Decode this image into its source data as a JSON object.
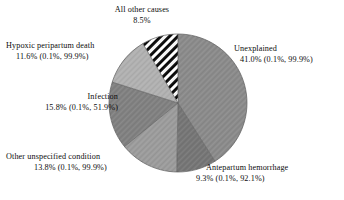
{
  "chart_data": {
    "type": "pie",
    "title": "",
    "subtitle": "",
    "xlabel": "",
    "ylabel": "",
    "legend_position": "none",
    "grid": false,
    "start_angle_deg": 0,
    "direction": "clockwise",
    "center": {
      "x": 178,
      "y": 103
    },
    "radius": 69,
    "categories": [
      "Unexplained",
      "Antepartum hemorrhage",
      "Other unspecified condition",
      "Infection",
      "Hypoxic peripartum death",
      "All other causes"
    ],
    "values": [
      41.0,
      9.3,
      13.8,
      15.8,
      11.6,
      8.5
    ],
    "slices": [
      {
        "name": "Unexplained",
        "label": "Unexplained",
        "percent": 41.0,
        "percent_text": "41.0%",
        "ci_text": "(0.1%, 99.9%)",
        "value_line": "41.0% (0.1%, 99.9%)",
        "ci_low": 0.1,
        "ci_high": 99.9,
        "fill": "#8b8b8b",
        "pattern": "solid"
      },
      {
        "name": "Antepartum hemorrhage",
        "label": "Antepartum hemorrhage",
        "percent": 9.3,
        "percent_text": "9.3%",
        "ci_text": "(0.1%, 92.1%)",
        "value_line": "9.3% (0.1%, 92.1%)",
        "ci_low": 0.1,
        "ci_high": 92.1,
        "fill": "#767676",
        "pattern": "solid"
      },
      {
        "name": "Other unspecified condition",
        "label": "Other unspecified condition",
        "percent": 13.8,
        "percent_text": "13.8%",
        "ci_text": "(0.1%, 99.9%)",
        "value_line": "13.8% (0.1%, 99.9%)",
        "ci_low": 0.1,
        "ci_high": 99.9,
        "fill": "#9c9c9c",
        "pattern": "solid"
      },
      {
        "name": "Infection",
        "label": "Infection",
        "percent": 15.8,
        "percent_text": "15.8%",
        "ci_text": "(0.1%, 51.9%)",
        "value_line": "15.8% (0.1%, 51.9%)",
        "ci_low": 0.1,
        "ci_high": 51.9,
        "fill": "#818181",
        "pattern": "solid"
      },
      {
        "name": "Hypoxic peripartum death",
        "label": "Hypoxic peripartum death",
        "percent": 11.6,
        "percent_text": "11.6%",
        "ci_text": "(0.1%, 99.9%)",
        "value_line": "11.6% (0.1%, 99.9%)",
        "ci_low": 0.1,
        "ci_high": 99.9,
        "fill": "#b1b1b1",
        "pattern": "solid"
      },
      {
        "name": "All other causes",
        "label": "All other causes",
        "percent": 8.5,
        "percent_text": "8.5%",
        "ci_text": "",
        "value_line": "8.5%",
        "fill": "#ffffff",
        "pattern": "diagonal-hatch-black"
      }
    ],
    "colors": {
      "background": "#ffffff",
      "text": "#0d0d0d",
      "hatch": "#000000"
    }
  }
}
